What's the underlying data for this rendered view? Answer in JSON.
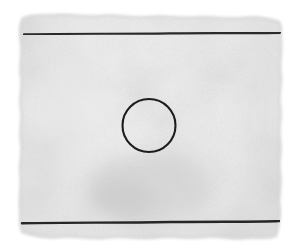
{
  "document": {
    "title": "Scanned paper sheet with ruled lines and circle",
    "width": 301,
    "height": 251,
    "background_color": "#ffffff"
  },
  "paper": {
    "name": "deckled-paper-sheet",
    "description": "Textured off-white paper with irregular wavy deckle edges",
    "base_color": "#ececec",
    "highlight_color": "#f6f6f6",
    "shadow_color": "#dcdcdc",
    "edge_shadow_color": "#d2d2d2",
    "bounds": {
      "left": 18,
      "top": 12,
      "right": 286,
      "bottom": 246
    }
  },
  "marks": {
    "rules": [
      {
        "name": "top-rule-line",
        "label": "Top horizontal ruled line",
        "x1": 24,
        "y1": 34,
        "x2": 280,
        "y2": 33,
        "stroke": "#2a2a2a",
        "stroke_width": 2.1
      },
      {
        "name": "bottom-rule-line",
        "label": "Bottom horizontal ruled line",
        "x1": 22,
        "y1": 223,
        "x2": 279,
        "y2": 221,
        "stroke": "#252525",
        "stroke_width": 2.4
      }
    ],
    "circle": {
      "name": "hand-drawn-circle",
      "label": "Hand-drawn circle outline",
      "cx": 149,
      "cy": 125.5,
      "rx": 26.5,
      "ry": 26.5,
      "stroke": "#1f1f1f",
      "stroke_width": 2.1,
      "fill": "none"
    },
    "smudge": {
      "name": "paper-smudge",
      "label": "Soft gray smudge in lower center of sheet",
      "cx": 150,
      "cy": 188,
      "rx": 62,
      "ry": 34,
      "color": "#c9c9c9"
    }
  },
  "texture": {
    "name": "paper-grain",
    "grain_opacity": 0.26,
    "mottle_opacity": 0.35
  }
}
